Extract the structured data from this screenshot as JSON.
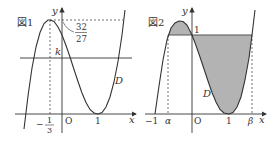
{
  "figure1": {
    "label": "図1",
    "y_axis_label": "y",
    "x_axis_label": "x",
    "origin_label": "O",
    "max_value_num": "32",
    "max_value_den": "27",
    "k_label": "k",
    "x_tick_1": "1",
    "x_tick_neg_third_num": "1",
    "x_tick_neg_third_den": "3",
    "x_tick_neg_third_sign": "−",
    "curve_label": "D"
  },
  "figure2": {
    "label": "図2",
    "y_axis_label": "y",
    "x_axis_label": "x",
    "origin_label": "O",
    "y_tick_1": "1",
    "x_tick_neg1": "−1",
    "x_tick_alpha": "α",
    "x_tick_1": "1",
    "x_tick_beta": "β",
    "curve_label": "D",
    "shade_color": "#b3b3b3"
  },
  "colors": {
    "line": "#333333",
    "shade": "#b3b3b3"
  }
}
